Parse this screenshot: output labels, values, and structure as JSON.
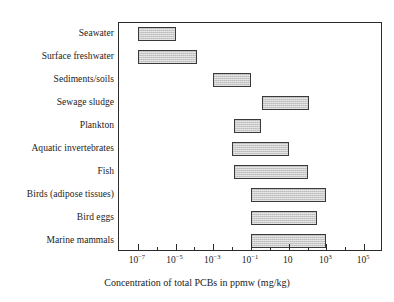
{
  "chart_data": {
    "type": "bar",
    "orientation": "horizontal-range",
    "title": "",
    "xlabel": "Concentration of total PCBs in ppmw (mg/kg)",
    "ylabel": "",
    "xscale": "log",
    "xlim": [
      1e-08,
      1000000.0
    ],
    "grid": false,
    "legend": null,
    "xtick_labels": [
      "10−7",
      "10−5",
      "10−3",
      "10−1",
      "10",
      "10³",
      "10⁵"
    ],
    "xtick_bases": [
      "10",
      "10",
      "10",
      "10",
      "10",
      "10",
      "10"
    ],
    "xtick_exponents": [
      "−7",
      "−5",
      "−3",
      "−1",
      "",
      "3",
      "5"
    ],
    "xtick_values": [
      1e-07,
      1e-05,
      0.001,
      0.1,
      10,
      1000,
      100000
    ],
    "minor_tick_values": [
      1e-08,
      1e-06,
      0.0001,
      0.01,
      1,
      100,
      10000,
      1000000
    ],
    "categories": [
      "Seawater",
      "Surface freshwater",
      "Sediments/soils",
      "Sewage sludge",
      "Plankton",
      "Aquatic invertebrates",
      "Fish",
      "Birds (adipose tissues)",
      "Bird eggs",
      "Marine mammals"
    ],
    "ranges": [
      {
        "category": "Seawater",
        "low": 1e-07,
        "high": 1e-05
      },
      {
        "category": "Surface freshwater",
        "low": 1e-07,
        "high": 0.00013
      },
      {
        "category": "Sediments/soils",
        "low": 0.001,
        "high": 0.1
      },
      {
        "category": "Sewage sludge",
        "low": 0.4,
        "high": 120.0
      },
      {
        "category": "Plankton",
        "low": 0.012,
        "high": 0.35
      },
      {
        "category": "Aquatic invertebrates",
        "low": 0.01,
        "high": 10.0
      },
      {
        "category": "Fish",
        "low": 0.012,
        "high": 100.0
      },
      {
        "category": "Birds (adipose tissues)",
        "low": 0.1,
        "high": 1000.0
      },
      {
        "category": "Bird eggs",
        "low": 0.1,
        "high": 300.0
      },
      {
        "category": "Marine mammals",
        "low": 0.1,
        "high": 1000.0
      }
    ],
    "colors": {
      "bar_fill": "#c9c9c9",
      "bar_border": "#3a3a3a",
      "axis": "#2b2b2b",
      "text": "#1a1a1a",
      "background": "#ffffff"
    }
  }
}
